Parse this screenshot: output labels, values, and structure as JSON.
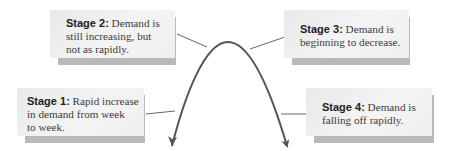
{
  "diagram": {
    "title": "",
    "curve": {
      "type": "inverted-parabola",
      "color": "#555555",
      "arrowheads": [
        "left-end",
        "right-end"
      ]
    },
    "stages": [
      {
        "id": 1,
        "label": "Stage 1:",
        "line1": " Rapid increase",
        "line2": "in demand from week",
        "line3": "to week."
      },
      {
        "id": 2,
        "label": "Stage 2:",
        "line1": " Demand is",
        "line2": "still increasing, but",
        "line3": "not as rapidly."
      },
      {
        "id": 3,
        "label": "Stage 3:",
        "line1": " Demand is",
        "line2": "beginning to decrease.",
        "line3": ""
      },
      {
        "id": 4,
        "label": "Stage 4:",
        "line1": " Demand is",
        "line2": "falling off rapidly.",
        "line3": ""
      }
    ]
  }
}
